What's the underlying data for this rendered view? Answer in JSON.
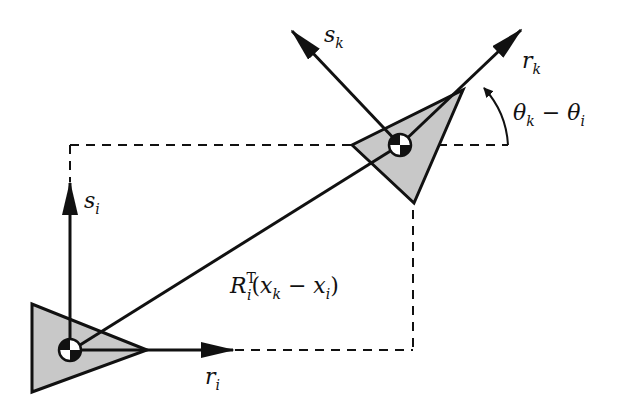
{
  "diagram": {
    "type": "relative-pose-frames",
    "colors": {
      "background": "#ffffff",
      "stroke": "#111111",
      "robot_fill": "#c8c8c8"
    },
    "frame_i": {
      "r_label": "r",
      "r_sub": "i",
      "s_label": "s",
      "s_sub": "i"
    },
    "frame_k": {
      "r_label": "r",
      "r_sub": "k",
      "s_label": "s",
      "s_sub": "k"
    },
    "angle_label": {
      "theta1": "θ",
      "theta1_sub": "k",
      "minus": " − ",
      "theta2": "θ",
      "theta2_sub": "i"
    },
    "vector_label": {
      "R": "R",
      "R_sup": "T",
      "R_sub": "i",
      "open": "(",
      "x1": "x",
      "x1_sub": "k",
      "minus": " − ",
      "x2": "x",
      "x2_sub": "i",
      "close": ")"
    }
  }
}
